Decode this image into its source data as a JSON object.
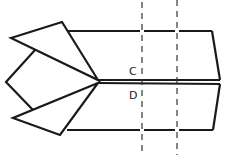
{
  "diagram": {
    "type": "geometry-folding-figure",
    "stroke_color": "#1a1a1a",
    "labels": [
      {
        "id": "C",
        "text": "C",
        "x": 129,
        "y": 66
      },
      {
        "id": "D",
        "text": "D",
        "x": 129,
        "y": 90
      }
    ],
    "fold_lines": [
      {
        "x": 142,
        "style": "dashed"
      },
      {
        "x": 177,
        "style": "dashed"
      }
    ]
  }
}
